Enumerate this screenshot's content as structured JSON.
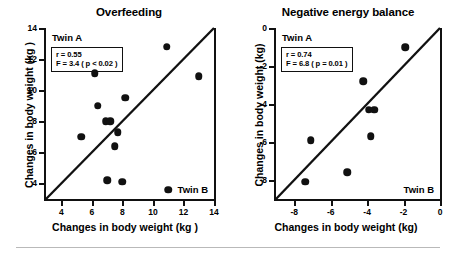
{
  "figure": {
    "background": "#ffffff",
    "point_color": "#111111",
    "axis_color": "#111111"
  },
  "panels": [
    {
      "title": "Overfeeding",
      "corner_top_left": "Twin A",
      "corner_bottom_right": "Twin B",
      "stats": {
        "r": "r = 0.55",
        "f": "F = 3.4 ( p < 0.02 )"
      },
      "xlabel": "Changes in body weight (kg )",
      "ylabel": "Changes in body weight (kg )",
      "xticks": [
        "4",
        "6",
        "8",
        "10",
        "12",
        "14"
      ],
      "yticks": [
        "4",
        "6",
        "8",
        "10",
        "12",
        "14"
      ]
    },
    {
      "title": "Negative energy balance",
      "corner_top_left": "Twin A",
      "corner_bottom_right": "Twin B",
      "stats": {
        "r": "r = 0.74",
        "f": "F = 6.8 ( p = 0.01 )"
      },
      "xlabel": "Changes in body weight (kg)",
      "ylabel": "Changes in body weight (kg)",
      "xticks": [
        "-8",
        "-6",
        "-4",
        "-2",
        "0"
      ],
      "yticks": [
        "0",
        "-2",
        "-4",
        "-6",
        "-8"
      ]
    }
  ],
  "chart_data": [
    {
      "type": "scatter",
      "title": "Overfeeding",
      "xlabel": "Changes in body weight (kg )",
      "ylabel": "Changes in body weight (kg )",
      "xlim": [
        3.0,
        14.0
      ],
      "ylim": [
        3.0,
        14.0
      ],
      "xticks": [
        4,
        6,
        8,
        10,
        12,
        14
      ],
      "yticks": [
        4,
        6,
        8,
        10,
        12,
        14
      ],
      "grid": false,
      "legend": "none",
      "annotations": {
        "top_left": "Twin A",
        "bottom_right": "Twin B",
        "r": 0.55,
        "F": 3.4,
        "p": "< 0.02"
      },
      "reference_line": {
        "type": "identity",
        "label": "line of equality",
        "from": [
          3.0,
          3.0
        ],
        "to": [
          14.0,
          14.0
        ]
      },
      "series": [
        {
          "name": "Twin pairs",
          "x": [
            5.3,
            6.2,
            6.4,
            6.9,
            7.0,
            7.2,
            7.5,
            7.7,
            8.0,
            8.2,
            10.9,
            11.0,
            13.0
          ],
          "y": [
            7.0,
            11.1,
            9.0,
            8.0,
            4.2,
            8.0,
            6.4,
            7.3,
            4.1,
            9.5,
            12.8,
            3.6,
            10.9
          ]
        }
      ]
    },
    {
      "type": "scatter",
      "title": "Negative energy balance",
      "xlabel": "Changes in body weight (kg)",
      "ylabel": "Changes in body weight (kg)",
      "xlim": [
        -9.0,
        0.0
      ],
      "ylim": [
        -9.0,
        0.0
      ],
      "xticks": [
        -8,
        -6,
        -4,
        -2,
        0
      ],
      "yticks": [
        0,
        -2,
        -4,
        -6,
        -8
      ],
      "grid": false,
      "legend": "none",
      "annotations": {
        "top_left": "Twin A",
        "bottom_right": "Twin B",
        "r": 0.74,
        "F": 6.8,
        "p": "= 0.01"
      },
      "reference_line": {
        "type": "identity",
        "label": "line of equality",
        "from": [
          -9.0,
          -9.0
        ],
        "to": [
          0.0,
          0.0
        ]
      },
      "series": [
        {
          "name": "Twin pairs",
          "x": [
            -7.4,
            -7.1,
            -5.1,
            -4.2,
            -3.9,
            -3.8,
            -3.6,
            -1.9
          ],
          "y": [
            -8.1,
            -5.9,
            -7.6,
            -2.8,
            -4.3,
            -5.7,
            -4.3,
            -1.0
          ]
        }
      ]
    }
  ]
}
